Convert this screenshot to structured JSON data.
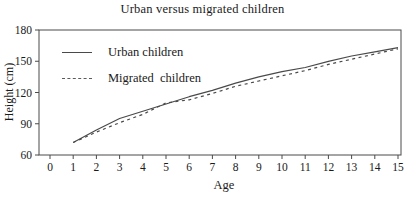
{
  "title": "Urban versus migrated children",
  "chart_data": {
    "type": "line",
    "title": "Urban versus migrated children",
    "xlabel": "Age",
    "ylabel": "Height (cm)",
    "xlim": [
      0,
      15
    ],
    "ylim": [
      60,
      180
    ],
    "xticks": [
      0,
      1,
      2,
      3,
      4,
      5,
      6,
      7,
      8,
      9,
      10,
      11,
      12,
      13,
      14,
      15
    ],
    "yticks": [
      60,
      90,
      120,
      150,
      180
    ],
    "grid": false,
    "legend_position": "top-left",
    "frame": "full-box",
    "line_color": "#4a4a4a",
    "text_color": "#1a1a1a",
    "x": [
      1,
      2,
      3,
      4,
      5,
      6,
      7,
      8,
      9,
      10,
      11,
      12,
      13,
      14,
      15
    ],
    "series": [
      {
        "name": "Urban children",
        "style": "solid",
        "values": [
          72,
          84,
          95,
          102,
          109,
          116,
          122,
          129,
          135,
          140,
          144,
          150,
          155,
          159,
          163
        ]
      },
      {
        "name": "Migrated  children",
        "style": "dashed",
        "values": [
          72,
          82,
          91,
          99,
          110,
          113,
          119,
          126,
          131,
          136,
          141,
          147,
          152,
          157,
          162
        ]
      }
    ]
  }
}
